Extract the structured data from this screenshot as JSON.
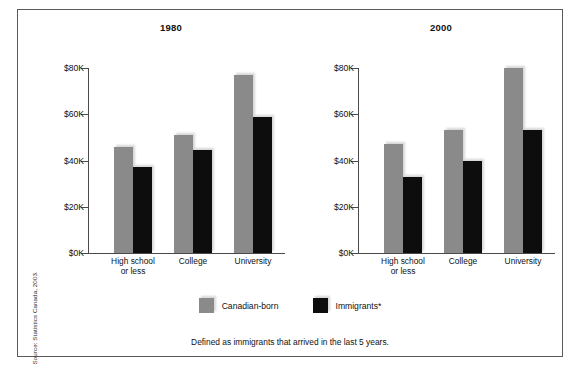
{
  "source_credit": "Source: Statistics Canada, 2003.",
  "legend": {
    "items": [
      {
        "label": "Canadian-born",
        "color": "#8a8a8a",
        "key": "canadian-born"
      },
      {
        "label": "Immigrants*",
        "color": "#0d0d0d",
        "key": "immigrants"
      }
    ]
  },
  "footnote": "Defined as immigrants that arrived in the last 5 years.",
  "axis": {
    "tick_labels": [
      "$80K",
      "$60K",
      "$40K",
      "$20K",
      "$0K"
    ],
    "tick_values": [
      80,
      60,
      40,
      20,
      0
    ]
  },
  "categories": [
    {
      "line1": "High school",
      "line2": "or less"
    },
    {
      "line1": "College",
      "line2": ""
    },
    {
      "line1": "University",
      "line2": ""
    }
  ],
  "panels": [
    {
      "title": "1980"
    },
    {
      "title": "2000"
    }
  ],
  "chart_data": [
    {
      "type": "bar",
      "title": "1980",
      "xlabel": "",
      "ylabel": "",
      "ylim": [
        0,
        80
      ],
      "yunit": "thousands of dollars (CAD)",
      "ytick_labels": [
        "$0K",
        "$20K",
        "$40K",
        "$60K",
        "$80K"
      ],
      "grid": false,
      "legend_position": "bottom-center",
      "categories": [
        "High school or less",
        "College",
        "University"
      ],
      "series": [
        {
          "name": "Canadian-born",
          "color": "#8a8a8a",
          "values": [
            46,
            51,
            77
          ]
        },
        {
          "name": "Immigrants*",
          "color": "#0d0d0d",
          "values": [
            37,
            44.5,
            59
          ]
        }
      ]
    },
    {
      "type": "bar",
      "title": "2000",
      "xlabel": "",
      "ylabel": "",
      "ylim": [
        0,
        80
      ],
      "yunit": "thousands of dollars (CAD)",
      "ytick_labels": [
        "$0K",
        "$20K",
        "$40K",
        "$60K",
        "$80K"
      ],
      "grid": false,
      "legend_position": "bottom-center",
      "categories": [
        "High school or less",
        "College",
        "University"
      ],
      "series": [
        {
          "name": "Canadian-born",
          "color": "#8a8a8a",
          "values": [
            47,
            53,
            80
          ]
        },
        {
          "name": "Immigrants*",
          "color": "#0d0d0d",
          "values": [
            33,
            40,
            53
          ]
        }
      ]
    }
  ]
}
